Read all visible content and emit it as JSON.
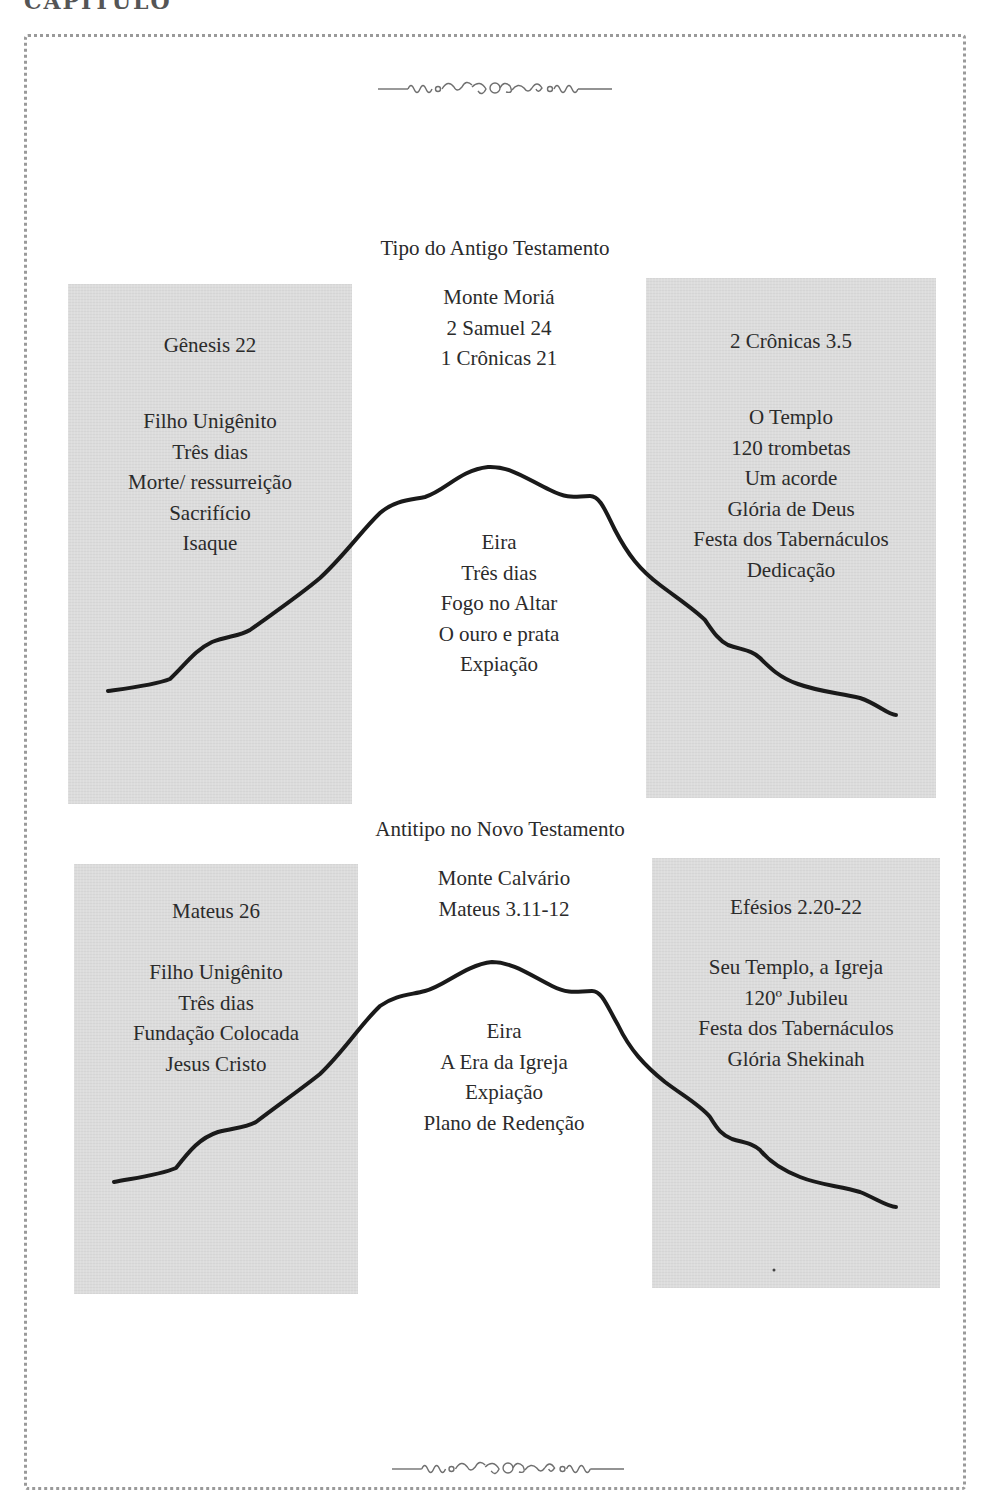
{
  "page": {
    "running_head": "CAPÍTULO",
    "ornament_top": "ornamental-divider",
    "ornament_bottom": "ornamental-divider"
  },
  "old_testament": {
    "title": "Tipo do Antigo Testamento",
    "center_top": [
      "Monte Moriá",
      "2 Samuel 24",
      "1 Crônicas 21"
    ],
    "left_box": {
      "heading": "Gênesis 22",
      "items": [
        "Filho Unigênito",
        "Três dias",
        "Morte/ ressurreição",
        "Sacrifício",
        "Isaque"
      ]
    },
    "right_box": {
      "heading": "2 Crônicas 3.5",
      "items": [
        "O Templo",
        "120 trombetas",
        "Um acorde",
        "Glória de Deus",
        "Festa dos Tabernáculos",
        "Dedicação"
      ]
    },
    "center_mountain": [
      "Eira",
      "Três dias",
      "Fogo no Altar",
      "O ouro e prata",
      "Expiação"
    ]
  },
  "new_testament": {
    "title": "Antitipo no Novo Testamento",
    "center_top": [
      "Monte Calvário",
      "Mateus 3.11-12"
    ],
    "left_box": {
      "heading": "Mateus 26",
      "items": [
        "Filho Unigênito",
        "Três dias",
        "Fundação Colocada",
        "Jesus Cristo"
      ]
    },
    "right_box": {
      "heading": "Efésios 2.20-22",
      "items": [
        "Seu Templo, a Igreja",
        "120º Jubileu",
        "Festa dos Tabernáculos",
        "Glória Shekinah"
      ]
    },
    "center_mountain": [
      "Eira",
      "A Era da Igreja",
      "Expiação",
      "Plano de Redenção"
    ]
  },
  "colors": {
    "box_fill": "#dcdcdc",
    "mountain_line": "#1a1a1a",
    "border": "#9a9a9a"
  }
}
